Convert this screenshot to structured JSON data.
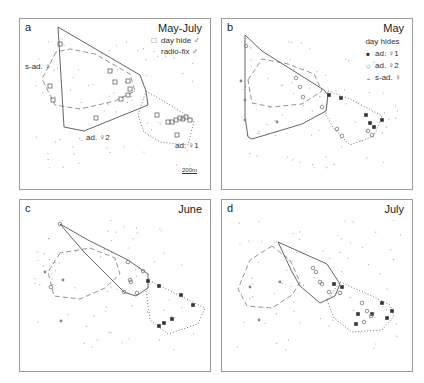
{
  "figure": {
    "panels": [
      {
        "id": "a",
        "label": "a",
        "title": "May-July",
        "legend": {
          "heading": "",
          "items": [
            {
              "marker": "□",
              "text": "day hide ♂"
            },
            {
              "marker": "·",
              "text": "radio-fix ♂"
            }
          ]
        },
        "annotations": [
          {
            "text": "s-ad. ♀",
            "x": 7,
            "y": 44
          },
          {
            "text": "ad. ♀2",
            "x": 66,
            "y": 115
          },
          {
            "text": "ad. ♀1",
            "x": 155,
            "y": 124
          }
        ],
        "scale_bar": "200m"
      },
      {
        "id": "b",
        "label": "b",
        "title": "May",
        "legend": {
          "heading": "day hides",
          "items": [
            {
              "marker": "■",
              "text": "ad. ♀1"
            },
            {
              "marker": "◇",
              "text": "ad. ♀2"
            },
            {
              "marker": "▵",
              "text": "s-ad. ♀"
            }
          ]
        },
        "annotations": []
      },
      {
        "id": "c",
        "label": "c",
        "title": "June",
        "legend": {
          "heading": "",
          "items": []
        },
        "annotations": []
      },
      {
        "id": "d",
        "label": "d",
        "title": "July",
        "legend": {
          "heading": "",
          "items": []
        },
        "annotations": []
      }
    ]
  },
  "chart_data": {
    "type": "map",
    "panels": [
      {
        "id": "a",
        "title": "May-July",
        "solid_polygon": [
          [
            38,
            8
          ],
          [
            120,
            56
          ],
          [
            126,
            72
          ],
          [
            128,
            86
          ],
          [
            64,
            112
          ],
          [
            44,
            108
          ]
        ],
        "dashed_polygon": [
          [
            36,
            33
          ],
          [
            22,
            60
          ],
          [
            35,
            86
          ],
          [
            60,
            90
          ],
          [
            95,
            82
          ],
          [
            115,
            72
          ],
          [
            110,
            55
          ],
          [
            75,
            35
          ],
          [
            50,
            30
          ]
        ],
        "dotted_polygon": [
          [
            126,
            72
          ],
          [
            150,
            86
          ],
          [
            166,
            96
          ],
          [
            174,
            102
          ],
          [
            168,
            126
          ],
          [
            140,
            123
          ],
          [
            124,
            113
          ],
          [
            118,
            96
          ]
        ],
        "day_hides_male": [
          [
            40,
            25
          ],
          [
            90,
            52
          ],
          [
            95,
            63
          ],
          [
            108,
            62
          ],
          [
            110,
            70
          ],
          [
            108,
            76
          ],
          [
            101,
            80
          ],
          [
            76,
            99
          ],
          [
            30,
            67
          ],
          [
            33,
            81
          ],
          [
            137,
            96
          ],
          [
            148,
            103
          ],
          [
            152,
            103
          ],
          [
            156,
            101
          ],
          [
            160,
            99
          ],
          [
            163,
            100
          ],
          [
            166,
            98
          ],
          [
            170,
            101
          ],
          [
            157,
            116
          ]
        ],
        "radio_fix_count_estimate": 90
      },
      {
        "id": "b",
        "title": "May",
        "solid_polygon": [
          [
            23,
            16
          ],
          [
            40,
            32
          ],
          [
            102,
            71
          ],
          [
            106,
            76
          ],
          [
            104,
            92
          ],
          [
            80,
            105
          ],
          [
            30,
            120
          ],
          [
            26,
            118
          ],
          [
            23,
            98
          ]
        ],
        "dashed_polygon": [
          [
            26,
            61
          ],
          [
            40,
            40
          ],
          [
            66,
            45
          ],
          [
            92,
            55
          ],
          [
            100,
            72
          ],
          [
            80,
            85
          ],
          [
            50,
            88
          ],
          [
            30,
            84
          ]
        ],
        "dotted_polygon": [
          [
            106,
            72
          ],
          [
            128,
            80
          ],
          [
            160,
            97
          ],
          [
            152,
            117
          ],
          [
            128,
            126
          ],
          [
            112,
            110
          ],
          [
            104,
            96
          ]
        ],
        "ad_f1_hides": [
          [
            107,
            76
          ],
          [
            119,
            79
          ],
          [
            144,
            96
          ],
          [
            148,
            104
          ],
          [
            152,
            108
          ],
          [
            160,
            101
          ]
        ],
        "ad_f2_hides": [
          [
            24,
            27
          ],
          [
            74,
            59
          ],
          [
            78,
            68
          ],
          [
            81,
            78
          ],
          [
            100,
            88
          ],
          [
            115,
            110
          ],
          [
            120,
            117
          ],
          [
            150,
            116
          ],
          [
            146,
            112
          ]
        ],
        "s_ad_f_hides": [
          [
            19,
            62
          ],
          [
            23,
            81
          ],
          [
            23,
            101
          ],
          [
            55,
            103
          ]
        ]
      },
      {
        "id": "c",
        "title": "June",
        "solid_polygon": [
          [
            40,
            24
          ],
          [
            68,
            40
          ],
          [
            108,
            60
          ],
          [
            128,
            74
          ],
          [
            128,
            88
          ],
          [
            116,
            96
          ],
          [
            104,
            92
          ],
          [
            64,
            52
          ]
        ],
        "dashed_polygon": [
          [
            40,
            53
          ],
          [
            28,
            72
          ],
          [
            34,
            96
          ],
          [
            60,
            99
          ],
          [
            85,
            88
          ],
          [
            100,
            74
          ],
          [
            95,
            58
          ],
          [
            70,
            48
          ]
        ],
        "dotted_polygon": [
          [
            132,
            82
          ],
          [
            185,
            108
          ],
          [
            178,
            124
          ],
          [
            148,
            134
          ],
          [
            130,
            120
          ],
          [
            126,
            90
          ]
        ],
        "ad_f1_hides": [
          [
            128,
            81
          ],
          [
            139,
            86
          ],
          [
            161,
            95
          ],
          [
            173,
            105
          ],
          [
            152,
            119
          ],
          [
            144,
            123
          ],
          [
            139,
            126
          ]
        ],
        "ad_f2_hides": [
          [
            40,
            24
          ],
          [
            108,
            62
          ],
          [
            123,
            71
          ],
          [
            110,
            80
          ],
          [
            111,
            82
          ],
          [
            117,
            93
          ],
          [
            104,
            92
          ],
          [
            31,
            87
          ]
        ],
        "s_ad_f_hides": [
          [
            25,
            72
          ],
          [
            43,
            80
          ],
          [
            41,
            121
          ]
        ]
      },
      {
        "id": "d",
        "title": "July",
        "solid_polygon": [
          [
            56,
            42
          ],
          [
            105,
            64
          ],
          [
            118,
            84
          ],
          [
            113,
            96
          ],
          [
            98,
            103
          ],
          [
            78,
            86
          ],
          [
            70,
            72
          ]
        ],
        "dashed_polygon": [
          [
            50,
            46
          ],
          [
            28,
            60
          ],
          [
            16,
            89
          ],
          [
            25,
            106
          ],
          [
            50,
            108
          ],
          [
            70,
            95
          ],
          [
            78,
            82
          ],
          [
            68,
            60
          ]
        ],
        "dotted_polygon": [
          [
            118,
            82
          ],
          [
            150,
            96
          ],
          [
            168,
            105
          ],
          [
            172,
            116
          ],
          [
            160,
            130
          ],
          [
            130,
            132
          ],
          [
            112,
            118
          ],
          [
            105,
            100
          ]
        ],
        "ad_f1_hides": [
          [
            112,
            84
          ],
          [
            120,
            87
          ],
          [
            160,
            103
          ],
          [
            170,
            111
          ],
          [
            136,
            114
          ],
          [
            150,
            114
          ],
          [
            134,
            124
          ],
          [
            165,
            118
          ]
        ],
        "ad_f2_hides": [
          [
            91,
            68
          ],
          [
            94,
            72
          ],
          [
            98,
            82
          ],
          [
            100,
            84
          ],
          [
            107,
            92
          ],
          [
            118,
            93
          ],
          [
            140,
            103
          ],
          [
            145,
            111
          ],
          [
            149,
            116
          ],
          [
            142,
            122
          ]
        ],
        "s_ad_f_hides": [
          [
            28,
            87
          ],
          [
            58,
            82
          ],
          [
            37,
            120
          ]
        ]
      }
    ]
  }
}
